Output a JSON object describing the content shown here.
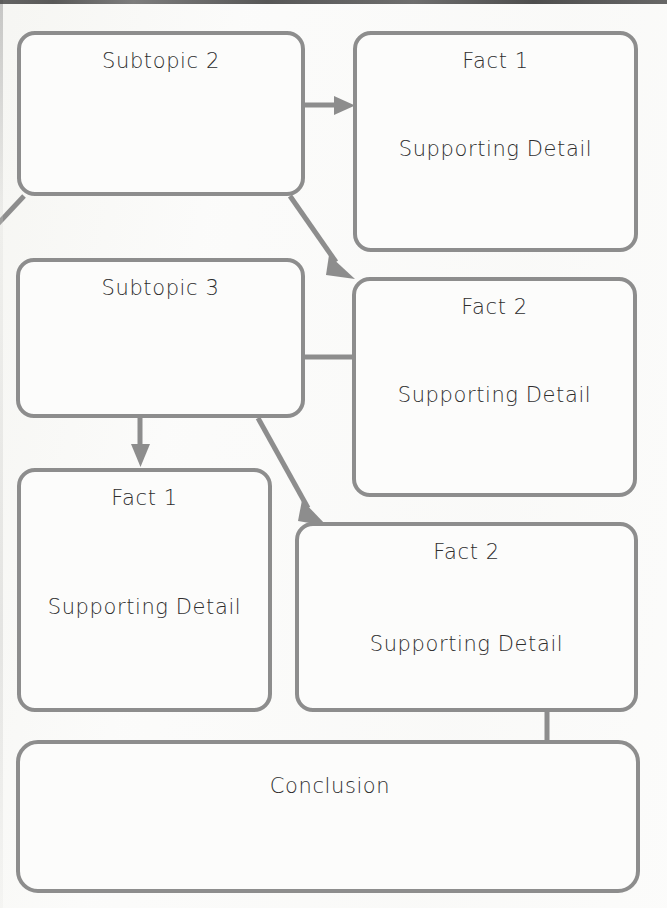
{
  "page": {
    "kind": "concept-map-worksheet",
    "width": 667,
    "height": 908,
    "background_color": "#fbfbfa",
    "line_color": "#8d8d8d",
    "text_color": "#2e2e2e"
  },
  "nodes": [
    {
      "id": "subtopic-2",
      "title": "Subtopic 2",
      "detail": "",
      "x": 17,
      "y": 31,
      "w": 288,
      "h": 165
    },
    {
      "id": "subtopic-2-fact-1",
      "title": "Fact 1",
      "detail": "Supporting Detail",
      "x": 353,
      "y": 31,
      "w": 285,
      "h": 221
    },
    {
      "id": "subtopic-3",
      "title": "Subtopic 3",
      "detail": "",
      "x": 16,
      "y": 258,
      "w": 289,
      "h": 160
    },
    {
      "id": "subtopic-2-fact-2",
      "title": "Fact 2",
      "detail": "Supporting Detail",
      "x": 352,
      "y": 277,
      "w": 285,
      "h": 220
    },
    {
      "id": "subtopic-3-fact-1",
      "title": "Fact 1",
      "detail": "Supporting Detail",
      "x": 17,
      "y": 468,
      "w": 255,
      "h": 244
    },
    {
      "id": "subtopic-3-fact-2",
      "title": "Fact 2",
      "detail": "Supporting Detail",
      "x": 295,
      "y": 522,
      "w": 343,
      "h": 190
    },
    {
      "id": "conclusion",
      "title": "Conclusion",
      "detail": "",
      "x": 16,
      "y": 740,
      "w": 624,
      "h": 153
    }
  ],
  "connectors": [
    {
      "id": "offscreen-to-subtopic-2",
      "from": "off-canvas-left",
      "to": "subtopic-2",
      "arrow": false
    },
    {
      "id": "subtopic-2-to-fact-1",
      "from": "subtopic-2",
      "to": "subtopic-2-fact-1",
      "arrow": true
    },
    {
      "id": "subtopic-2-to-fact-2",
      "from": "subtopic-2",
      "to": "subtopic-2-fact-2",
      "arrow": true
    },
    {
      "id": "subtopic-3-to-fact-2-upper",
      "from": "subtopic-3",
      "to": "subtopic-2-fact-2",
      "arrow": false
    },
    {
      "id": "subtopic-3-to-fact-1",
      "from": "subtopic-3",
      "to": "subtopic-3-fact-1",
      "arrow": true
    },
    {
      "id": "subtopic-3-to-fact-2",
      "from": "subtopic-3",
      "to": "subtopic-3-fact-2",
      "arrow": true
    },
    {
      "id": "fact-2-to-conclusion",
      "from": "subtopic-3-fact-2",
      "to": "conclusion",
      "arrow": false
    }
  ]
}
